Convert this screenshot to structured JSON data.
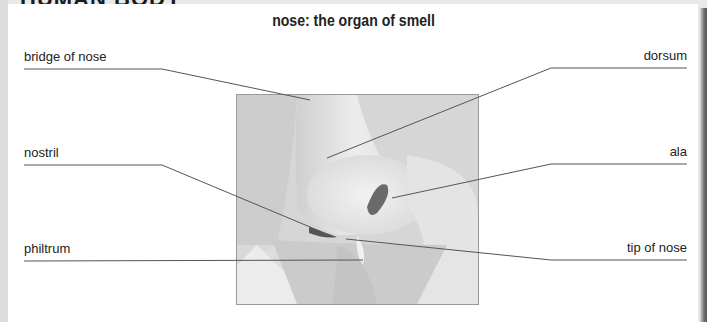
{
  "header": {
    "section_title": "HUMAN BODY"
  },
  "diagram": {
    "title": "nose: the organ of smell",
    "figure_alt": "close-up illustration of a human nose in profile",
    "labels": {
      "bridge_of_nose": "bridge of nose",
      "nostril": "nostril",
      "philtrum": "philtrum",
      "dorsum": "dorsum",
      "ala": "ala",
      "tip_of_nose": "tip of nose"
    }
  },
  "colors": {
    "panel_background": "#ffffff",
    "page_background": "#e9e9e9",
    "leader_line": "#555555",
    "text": "#222222"
  }
}
